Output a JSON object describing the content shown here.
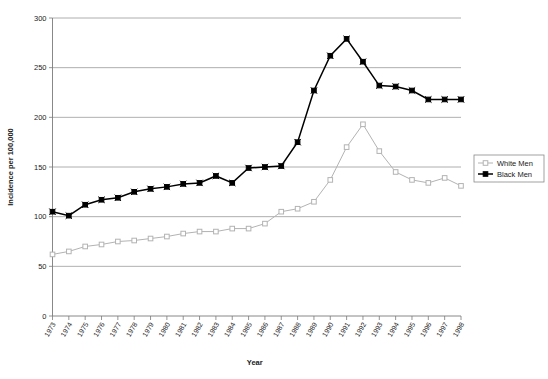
{
  "chart_data": {
    "type": "line",
    "title": "",
    "xlabel": "Year",
    "ylabel": "Incidence per 100,000",
    "grid": true,
    "legend_position": "right",
    "xlim": [
      1973,
      1998
    ],
    "ylim": [
      0,
      300
    ],
    "ytick_values": [
      0,
      50,
      100,
      150,
      200,
      250,
      300
    ],
    "ytick_labels": [
      "0",
      "50",
      "100",
      "150",
      "200",
      "250",
      "300"
    ],
    "categories": [
      "1973",
      "1974",
      "1975",
      "1976",
      "1977",
      "1978",
      "1979",
      "1980",
      "1981",
      "1982",
      "1983",
      "1984",
      "1985",
      "1986",
      "1987",
      "1988",
      "1989",
      "1990",
      "1991",
      "1992",
      "1993",
      "1994",
      "1995",
      "1996",
      "1997",
      "1998"
    ],
    "series": [
      {
        "name": "White Men",
        "color": "#b3b3b3",
        "marker": "open-square",
        "values": [
          62,
          65,
          70,
          72,
          75,
          76,
          78,
          80,
          83,
          85,
          85,
          88,
          88,
          93,
          105,
          108,
          115,
          137,
          170,
          193,
          166,
          145,
          137,
          134,
          139,
          131
        ]
      },
      {
        "name": "Black Men",
        "color": "#000000",
        "marker": "filled-square",
        "values": [
          105,
          101,
          112,
          117,
          119,
          125,
          128,
          130,
          133,
          134,
          141,
          134,
          149,
          150,
          151,
          175,
          227,
          262,
          279,
          256,
          232,
          231,
          227,
          218,
          218,
          218
        ]
      }
    ]
  },
  "legend": {
    "entries": [
      {
        "label": "White Men"
      },
      {
        "label": "Black Men"
      }
    ]
  },
  "colors": {
    "white_men": "#b3b3b3",
    "black_men": "#000000",
    "gridline": "#9a9a9a",
    "axis": "#7a7a7a",
    "background": "#ffffff"
  }
}
